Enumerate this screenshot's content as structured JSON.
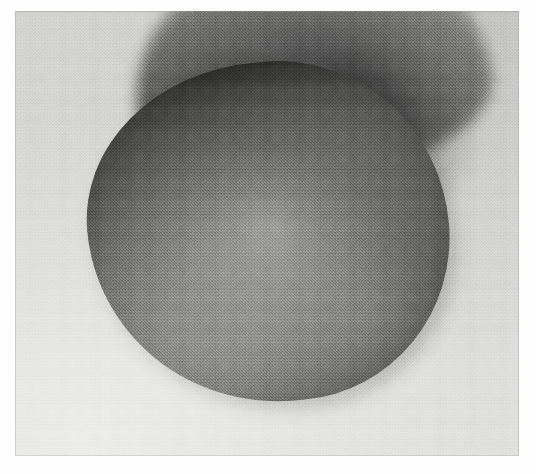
{
  "artwork": {
    "title": "Two Overlapping Ovoid Forms",
    "medium_appearance": "monochrome photographic plate of a smoothly modelled ovoid form",
    "orientation": "landscape",
    "canvas": {
      "width": 536,
      "height": 474
    },
    "border": {
      "name": "white print margin",
      "color": "#fefefe",
      "left": 15,
      "top": 11,
      "right": 17,
      "bottom": 18
    },
    "ground": {
      "name": "light grey paper ground",
      "top_color": "#d2d2d0",
      "bottom_color": "#e0e0de",
      "note": "ground lightens toward the lower left and darkens toward the upper right"
    },
    "subjects": [
      {
        "name": "rear lobe",
        "role": "background form",
        "position": "upper centre extending to upper right",
        "edge": "soft, diffuse; fades upward into the ground",
        "darkest_color": "#1f1f1f",
        "lightest_color": "#bcbcba"
      },
      {
        "name": "front lobe",
        "role": "dominant foreground form",
        "position": "centre, filling most of the plate",
        "edge": "crisp and continuous against the ground",
        "bounds": {
          "left": 88,
          "top": 62,
          "right": 449,
          "bottom": 402
        },
        "rim_color": "#484846",
        "mid_color": "#6e6e6c",
        "core_highlight_color": "#8f8f8d"
      }
    ],
    "features": [
      {
        "name": "top crease",
        "description": "near-black line where the front lobe crosses in front of the rear lobe",
        "color": "#101010"
      },
      {
        "name": "upper right shadow wedge",
        "description": "dark diffuse wedge where the rear lobe rolls away behind the front lobe",
        "color": "#1a1a1a"
      },
      {
        "name": "core whorl",
        "description": "concentric spiral of light in the centre of the front lobe",
        "color": "#a6a6a4"
      },
      {
        "name": "contact shadow",
        "description": "soft cast shadow on the ground at the lower right of the front lobe",
        "color": "#5a5a58"
      }
    ],
    "texture": {
      "name": "film grain",
      "description": "fine even photographic grain across the whole plate"
    }
  }
}
